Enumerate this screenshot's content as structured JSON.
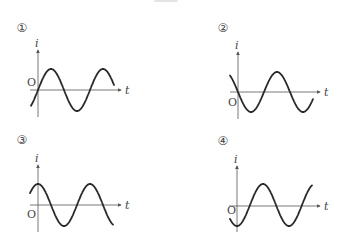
{
  "figure": {
    "axis_labels": {
      "y": "i",
      "x": "t",
      "origin": "O"
    },
    "stroke_color": "#2a2a2a",
    "axis_color": "#555555",
    "panels": [
      {
        "label": "①",
        "phase_description": "starts at zero, increasing (sine)",
        "origin": [
          38,
          90
        ],
        "y_axis_top": 50,
        "y_axis_bottom": 117,
        "x_axis_end": 121,
        "t_label_pos": [
          125,
          94
        ],
        "i_label_pos": [
          35,
          47
        ],
        "o_label_pos": [
          27,
          86
        ],
        "number_pos": [
          22,
          28
        ],
        "curve": {
          "x_start": 31,
          "x_end": 114,
          "center_y": 90,
          "amplitude": 21,
          "period": 52,
          "phase_x_zero_rising": 38
        }
      },
      {
        "label": "②",
        "phase_description": "starts at zero, decreasing (-sine)",
        "origin": [
          238,
          92
        ],
        "y_axis_top": 52,
        "y_axis_bottom": 119,
        "x_axis_end": 320,
        "t_label_pos": [
          324,
          96
        ],
        "i_label_pos": [
          235,
          49
        ],
        "o_label_pos": [
          228,
          106
        ],
        "number_pos": [
          223,
          28
        ],
        "curve": {
          "x_start": 230,
          "x_end": 313,
          "center_y": 92,
          "amplitude": 20,
          "period": 52,
          "phase_x_zero_rising": 264
        }
      },
      {
        "label": "③",
        "phase_description": "starts at maximum (cosine)",
        "origin": [
          38,
          205
        ],
        "y_axis_top": 165,
        "y_axis_bottom": 232,
        "x_axis_end": 121,
        "t_label_pos": [
          125,
          209
        ],
        "i_label_pos": [
          35,
          162
        ],
        "o_label_pos": [
          27,
          218
        ],
        "number_pos": [
          22,
          140
        ],
        "curve": {
          "x_start": 30,
          "x_end": 113,
          "center_y": 205,
          "amplitude": 21,
          "period": 52,
          "phase_x_zero_rising": 25
        }
      },
      {
        "label": "④",
        "phase_description": "starts at minimum (-cosine)",
        "origin": [
          237,
          206
        ],
        "y_axis_top": 166,
        "y_axis_bottom": 232,
        "x_axis_end": 320,
        "t_label_pos": [
          324,
          210
        ],
        "i_label_pos": [
          234,
          163
        ],
        "o_label_pos": [
          227,
          214
        ],
        "number_pos": [
          223,
          141
        ],
        "curve": {
          "x_start": 230,
          "x_end": 312,
          "center_y": 205,
          "amplitude": 21,
          "period": 52,
          "phase_x_zero_rising": 250
        }
      }
    ]
  }
}
